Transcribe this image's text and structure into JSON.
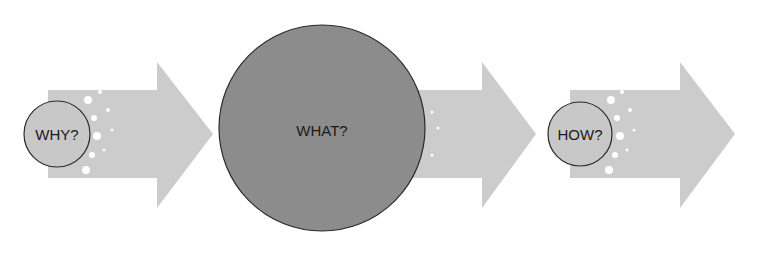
{
  "diagram": {
    "type": "process-flow",
    "colors": {
      "arrow": "#cccccc",
      "small_circle": "#c8c8c8",
      "large_circle": "#8c8c8c",
      "outline": "#2a2a2a",
      "text": "#1a1a1a"
    },
    "steps": [
      {
        "label": "WHY?",
        "size": "small"
      },
      {
        "label": "WHAT?",
        "size": "large"
      },
      {
        "label": "HOW?",
        "size": "small"
      }
    ]
  }
}
